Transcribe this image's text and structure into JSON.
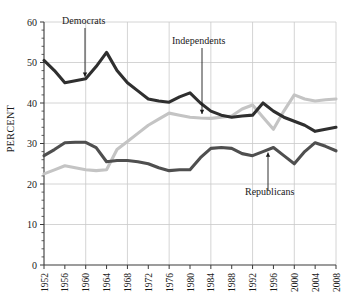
{
  "chart_data": {
    "type": "line",
    "title": "",
    "subtitle": "",
    "xlabel": "",
    "ylabel": "PERCENT",
    "ylim": [
      0,
      60
    ],
    "ytick_values": [
      0,
      10,
      20,
      30,
      40,
      50,
      60
    ],
    "ytick_labels": [
      "0",
      "10",
      "20",
      "30",
      "40",
      "50",
      "60"
    ],
    "grid": true,
    "legend_position": "inline-annotations",
    "x": [
      1952,
      1954,
      1956,
      1958,
      1960,
      1962,
      1964,
      1966,
      1968,
      1970,
      1972,
      1974,
      1976,
      1978,
      1980,
      1982,
      1984,
      1986,
      1988,
      1990,
      1992,
      1994,
      1996,
      1998,
      2000,
      2002,
      2004,
      2006,
      2008
    ],
    "xtick_values": [
      1952,
      1956,
      1960,
      1964,
      1968,
      1972,
      1976,
      1980,
      1984,
      1988,
      1992,
      1996,
      2000,
      2004,
      2008
    ],
    "xtick_labels": [
      "1952",
      "1956",
      "1960",
      "1964",
      "1968",
      "1972",
      "1976",
      "1980",
      "1984",
      "1988",
      "1992",
      "1996",
      "2000",
      "2004",
      "2008"
    ],
    "series": [
      {
        "name": "Democrats",
        "color": "#2f2f2f",
        "values": [
          50.5,
          48.0,
          45.0,
          45.5,
          46.0,
          49.0,
          52.5,
          48.0,
          45.0,
          43.0,
          41.0,
          40.5,
          40.2,
          41.5,
          42.5,
          40.0,
          38.0,
          37.0,
          36.5,
          36.8,
          37.0,
          40.0,
          38.0,
          36.5,
          35.5,
          34.5,
          33.0,
          33.5,
          34.0
        ]
      },
      {
        "name": "Independents",
        "color": "#c4c4c4",
        "values": [
          22.5,
          23.5,
          24.5,
          24.0,
          23.5,
          23.3,
          23.5,
          28.5,
          30.5,
          32.5,
          34.5,
          36.0,
          37.5,
          37.0,
          36.5,
          36.3,
          36.2,
          36.5,
          36.8,
          38.5,
          39.5,
          36.5,
          33.5,
          38.0,
          42.0,
          41.0,
          40.5,
          40.8,
          41.0
        ]
      },
      {
        "name": "Republicans",
        "color": "#4f4f4f",
        "values": [
          27.0,
          28.5,
          30.2,
          30.3,
          30.3,
          29.0,
          25.5,
          25.8,
          25.8,
          25.5,
          25.0,
          24.0,
          23.3,
          23.5,
          23.5,
          26.5,
          28.8,
          29.0,
          28.8,
          27.5,
          27.0,
          28.0,
          29.0,
          27.0,
          25.0,
          28.0,
          30.2,
          29.3,
          28.2
        ]
      }
    ],
    "annotations": [
      {
        "text": "Democrats",
        "series": "Democrats",
        "points_to_year": 1958
      },
      {
        "text": "Independents",
        "series": "Independents",
        "points_to_year": 1982
      },
      {
        "text": "Republicans",
        "series": "Republicans",
        "points_to_year": 1996
      }
    ]
  }
}
